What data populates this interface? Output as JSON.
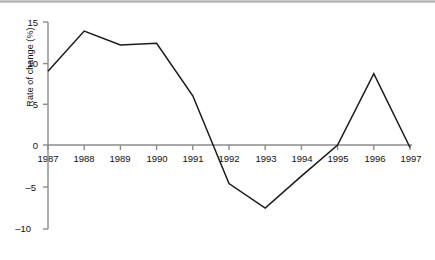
{
  "chart_data": {
    "type": "line",
    "title": "",
    "subtitle": "",
    "xlabel": "",
    "ylabel": "Rate of change (%)",
    "x": [
      1987,
      1988,
      1989,
      1990,
      1991,
      1992,
      1993,
      1994,
      1995,
      1996,
      1997
    ],
    "xtick_labels": [
      "1987",
      "1988",
      "1989",
      "1990",
      "1991",
      "1992",
      "1993",
      "1994",
      "1995",
      "1996",
      "1997"
    ],
    "ytick_labels": [
      "15",
      "10",
      "5",
      "0",
      "–5",
      "–10"
    ],
    "ytick_values": [
      15,
      10,
      5,
      0,
      -5,
      -10
    ],
    "ylim": [
      -10,
      15
    ],
    "xlim": [
      1987,
      1997
    ],
    "grid": false,
    "legend": false,
    "legend_position": "none",
    "series": [
      {
        "name": "Rate of change",
        "color": "#1a1a1a",
        "values": [
          9.0,
          13.9,
          12.2,
          12.4,
          6.0,
          -4.7,
          -7.7,
          -3.8,
          0.0,
          8.7,
          -0.3
        ]
      }
    ],
    "annotations": [
      {
        "text": "zero line crossing between 1991 and 1992"
      },
      {
        "text": "zero line crossing just before 1995"
      },
      {
        "text": "zero line crossing just before 1997"
      }
    ],
    "axis_color": "#8c8c8c",
    "line_color": "#1a1a1a",
    "background": "#ffffff"
  },
  "layout": {
    "axis_x_origin_px": 48,
    "axis_x_end_px": 410,
    "y_zero_px": 145,
    "y_top_px": 22,
    "y_bottom_px": 229
  }
}
